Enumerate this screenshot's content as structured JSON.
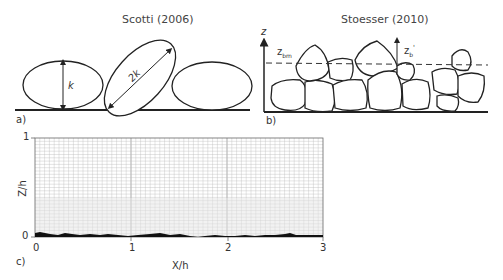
{
  "panel_a": {
    "title": "Scotti (2006)",
    "label": "a)",
    "dim_short": "k",
    "dim_long": "2k"
  },
  "panel_b": {
    "title": "Stoesser (2010)",
    "label": "b)",
    "axis_label": "z",
    "z_bm_label": "z",
    "z_bm_sub": "bm",
    "z_b_label": "z",
    "z_b_sub": "b",
    "z_b_prime": "'"
  },
  "panel_c": {
    "label": "c)",
    "xlabel": "X/h",
    "ylabel": "Z/h",
    "x_ticks": [
      "0",
      "1",
      "2",
      "3"
    ],
    "y_ticks": [
      "0",
      "1"
    ]
  },
  "chart_data": {
    "type": "area",
    "title": "",
    "xlabel": "X/h",
    "ylabel": "Z/h",
    "xlim": [
      0,
      3
    ],
    "ylim": [
      0,
      1
    ],
    "grid": true,
    "x_tick_labels": [
      "0",
      "1",
      "2",
      "3"
    ],
    "y_tick_labels": [
      "0",
      "1"
    ],
    "series": [
      {
        "name": "bed roughness profile",
        "x": [
          0,
          0.1,
          0.2,
          0.3,
          0.4,
          0.5,
          0.6,
          0.7,
          0.8,
          0.9,
          1.0,
          1.1,
          1.2,
          1.3,
          1.4,
          1.5,
          1.6,
          1.7,
          1.8,
          1.9,
          2.0,
          2.1,
          2.2,
          2.3,
          2.4,
          2.5,
          2.6,
          2.7,
          2.8,
          2.9,
          3.0
        ],
        "values": [
          0.04,
          0.05,
          0.03,
          0.02,
          0.05,
          0.03,
          0.04,
          0.03,
          0.04,
          0.03,
          0.02,
          0.03,
          0.03,
          0.04,
          0.03,
          0.03,
          0.02,
          0.01,
          0.02,
          0.03,
          0.02,
          0.03,
          0.02,
          0.02,
          0.02,
          0.03,
          0.03,
          0.05,
          0.03,
          0.03,
          0.02
        ]
      }
    ]
  }
}
